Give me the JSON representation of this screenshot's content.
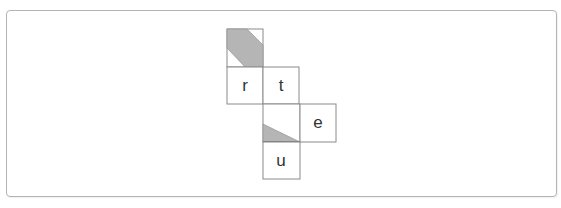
{
  "figure": {
    "type": "cube-net",
    "colors": {
      "stroke": "#8a8a8a",
      "shade": "#b5b5b5",
      "background": "#ffffff",
      "text": "#333333"
    },
    "cells": [
      {
        "id": "top",
        "label": "",
        "col": 0,
        "row": 0,
        "shading": "diagonal-band"
      },
      {
        "id": "r",
        "label": "r",
        "col": 0,
        "row": 1,
        "shading": "none"
      },
      {
        "id": "t",
        "label": "t",
        "col": 1,
        "row": 1,
        "shading": "none"
      },
      {
        "id": "middle",
        "label": "",
        "col": 1,
        "row": 2,
        "shading": "bottom-left-triangle"
      },
      {
        "id": "e",
        "label": "e",
        "col": 2,
        "row": 2,
        "shading": "none"
      },
      {
        "id": "u",
        "label": "u",
        "col": 1,
        "row": 3,
        "shading": "none"
      }
    ]
  }
}
